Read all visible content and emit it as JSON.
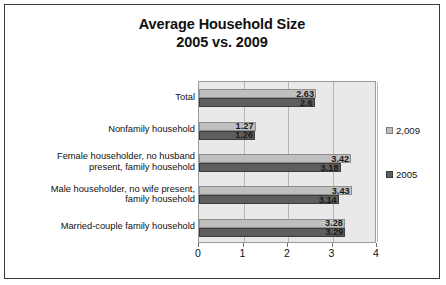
{
  "chart_data": {
    "type": "bar",
    "orientation": "horizontal",
    "title": "Average Household Size 2005 vs. 2009",
    "title_lines": [
      "Average Household Size",
      "2005 vs. 2009"
    ],
    "xlabel": "",
    "ylabel": "",
    "xlim": [
      0,
      4
    ],
    "xticks": [
      "0",
      "1",
      "2",
      "3",
      "4"
    ],
    "xtick_values": [
      0,
      1,
      2,
      3,
      4
    ],
    "grid": true,
    "legend_position": "right",
    "categories": [
      "Total",
      "Nonfamily household",
      "Female householder, no husband present, family household",
      "Male householder, no wife present, family household",
      "Married-couple family household"
    ],
    "category_lines": [
      [
        "Total"
      ],
      [
        "Nonfamily household"
      ],
      [
        "Female householder, no husband",
        "present, family household"
      ],
      [
        "Male householder, no wife present,",
        "family household"
      ],
      [
        "Married-couple family household"
      ]
    ],
    "series": [
      {
        "name": "2,009",
        "color": "#BFBFBF",
        "values": [
          2.63,
          1.27,
          3.42,
          3.43,
          3.28
        ],
        "labels": [
          "2.63",
          "1.27",
          "3.42",
          "3.43",
          "3.28"
        ]
      },
      {
        "name": "2005",
        "color": "#5E5E5E",
        "values": [
          2.6,
          1.26,
          3.18,
          3.14,
          3.29
        ],
        "labels": [
          "2.6",
          "1.26",
          "3.18",
          "3.14",
          "3.29"
        ]
      }
    ]
  },
  "legend": {
    "items": [
      {
        "label": "2,009"
      },
      {
        "label": "2005"
      }
    ]
  }
}
